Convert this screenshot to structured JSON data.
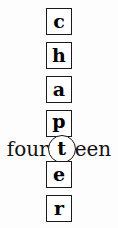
{
  "puzzle": {
    "hidden_word": "chapter",
    "boxed_letters_above": [
      {
        "letter": "c"
      },
      {
        "letter": "h"
      },
      {
        "letter": "a"
      },
      {
        "letter": "p"
      }
    ],
    "circled_letter": "t",
    "boxed_letters_below": [
      {
        "letter": "e"
      },
      {
        "letter": "r"
      }
    ],
    "number_word": {
      "prefix": "four",
      "circled": "t",
      "suffix": "een",
      "full": "fourteen"
    },
    "colors": {
      "ink": "#111111",
      "box_border": "#1a1a1a",
      "background": "#fdfdfd"
    }
  }
}
